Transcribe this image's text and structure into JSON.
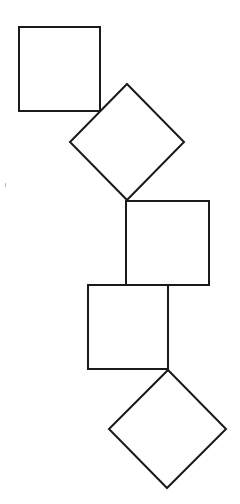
{
  "diagram": {
    "stroke_color": "#1a1a1a",
    "fill_color": "#ffffff",
    "background": "#ffffff",
    "shapes": [
      {
        "id": "square-1",
        "type": "square",
        "points": "19,27 100,27 100,111 19,111"
      },
      {
        "id": "diamond-1",
        "type": "diamond",
        "points": "127,84 184,142 127,200 70,142"
      },
      {
        "id": "square-2",
        "type": "square",
        "points": "126,201 209,201 209,285 126,285"
      },
      {
        "id": "square-3",
        "type": "square",
        "points": "88,285 168,285 168,369 88,369"
      },
      {
        "id": "diamond-2",
        "type": "diamond",
        "points": "168,370 226,429 167,488 109,429"
      }
    ]
  }
}
